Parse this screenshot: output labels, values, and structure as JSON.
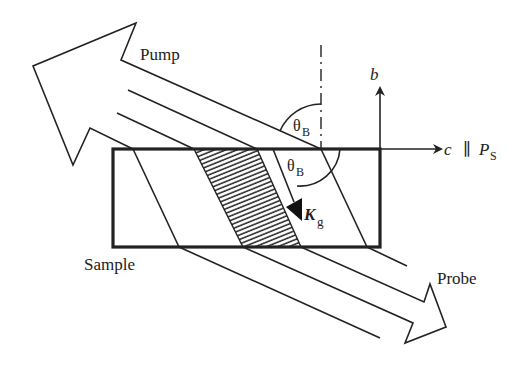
{
  "labels": {
    "pump": "Pump",
    "probe": "Probe",
    "sample": "Sample",
    "theta": "θ",
    "theta_sub": "B",
    "b_axis": "b",
    "c_axis": "c",
    "parallel": "∥",
    "p": "P",
    "p_sub": "S",
    "k": "K",
    "k_sub": "g"
  },
  "colors": {
    "stroke": "#222222",
    "background": "#ffffff"
  }
}
